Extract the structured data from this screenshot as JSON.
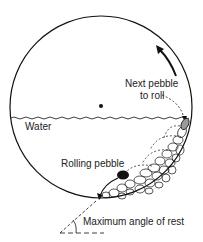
{
  "diagram": {
    "labels": {
      "next_pebble_line1": "Next pebble",
      "next_pebble_line2": "to roll",
      "water": "Water",
      "rolling_pebble": "Rolling pebble",
      "max_angle": "Maximum angle of rest"
    },
    "colors": {
      "stroke": "#111111",
      "background": "#ffffff",
      "next_pebble_fill": "#9a9a9a",
      "rolling_pebble_fill": "#111111"
    }
  }
}
